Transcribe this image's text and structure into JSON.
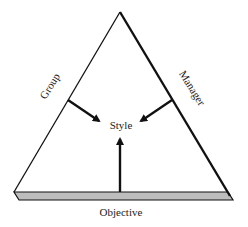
{
  "diagram": {
    "type": "triangle-influence",
    "center_label": "Style",
    "sides": {
      "left": "Group",
      "right": "Manager",
      "base": "Objective"
    },
    "arrows": [
      {
        "from": "Group",
        "to": "Style"
      },
      {
        "from": "Manager",
        "to": "Style"
      },
      {
        "from": "Objective",
        "to": "Style"
      }
    ],
    "colors": {
      "line": "#111111",
      "base_fill": "#bdbdbd",
      "text": "#222222",
      "background": "#ffffff"
    }
  }
}
